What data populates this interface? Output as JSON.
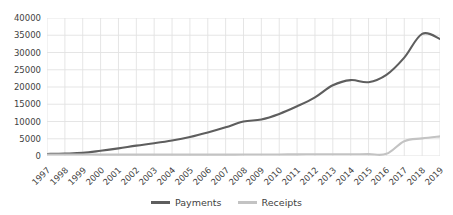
{
  "chart_data": {
    "type": "line",
    "title": "",
    "xlabel": "",
    "ylabel": "",
    "ylim": [
      0,
      40000
    ],
    "ytick_labels": [
      "40000",
      "35000",
      "30000",
      "25000",
      "20000",
      "15000",
      "10000",
      "5000",
      "0"
    ],
    "ytick_values": [
      40000,
      35000,
      30000,
      25000,
      20000,
      15000,
      10000,
      5000,
      0
    ],
    "grid": true,
    "legend_position": "bottom",
    "categories": [
      "1997",
      "1998",
      "1999",
      "2000",
      "2001",
      "2002",
      "2003",
      "2004",
      "2005",
      "2006",
      "2007",
      "2008",
      "2009",
      "2010",
      "2011",
      "2012",
      "2013",
      "2014",
      "2015",
      "2016",
      "2017",
      "2018",
      "2019"
    ],
    "series": [
      {
        "name": "Payments",
        "color": "#5e5e5e",
        "values": [
          600,
          700,
          900,
          1500,
          2200,
          3000,
          3700,
          4500,
          5500,
          6800,
          8300,
          10000,
          10600,
          12200,
          14400,
          17000,
          20500,
          22000,
          21400,
          23500,
          28500,
          35400,
          33900
        ]
      },
      {
        "name": "Receipts",
        "color": "#c3c3c3",
        "values": [
          450,
          430,
          420,
          410,
          400,
          400,
          400,
          400,
          400,
          400,
          400,
          420,
          430,
          450,
          480,
          500,
          520,
          520,
          540,
          620,
          4300,
          5100,
          5700
        ]
      }
    ]
  },
  "legend": {
    "items": [
      {
        "label": "Payments",
        "color": "#5e5e5e"
      },
      {
        "label": "Receipts",
        "color": "#c3c3c3"
      }
    ]
  },
  "colors": {
    "gridline": "#e2e2e2",
    "axis_text": "#3f3f3f",
    "background": "#ffffff"
  }
}
